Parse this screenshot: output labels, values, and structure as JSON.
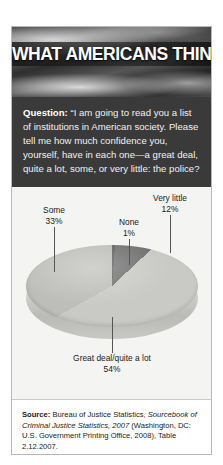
{
  "header": {
    "title": "WHAT AMERICANS THINK",
    "background_image": "grayscale-flag-photo"
  },
  "question": {
    "label": "Question:",
    "text": "“I am going to read you a list of institutions in American society. Please tell me how much confidence you, yourself, have in each one—a great deal, quite a lot, some, or very little: the police?"
  },
  "chart_data": {
    "type": "pie",
    "title": "",
    "categories": [
      "Great deal/quite a lot",
      "Some",
      "Very little",
      "None"
    ],
    "values": [
      54,
      33,
      12,
      1
    ],
    "value_labels": [
      "54%",
      "33%",
      "12%",
      "1%"
    ],
    "colors": [
      "#c9c9c5",
      "#bdbdb9",
      "#6f6f6f",
      "#5d5d5d"
    ],
    "legend": "labels-with-leader-lines",
    "three_d": true,
    "labels": [
      {
        "name": "Some",
        "percent": "33%"
      },
      {
        "name": "None",
        "percent": "1%"
      },
      {
        "name": "Very little",
        "percent": "12%"
      },
      {
        "name": "Great deal/quite a lot",
        "percent": "54%"
      }
    ]
  },
  "source": {
    "label": "Source:",
    "part1": " Bureau of Justice Statistics, ",
    "italic": "Sourcebook of Criminal Justice Statistics, 2007",
    "part2": " (Washington, DC: U.S. Government Printing Office, 2008), Table 2.12.2007."
  }
}
